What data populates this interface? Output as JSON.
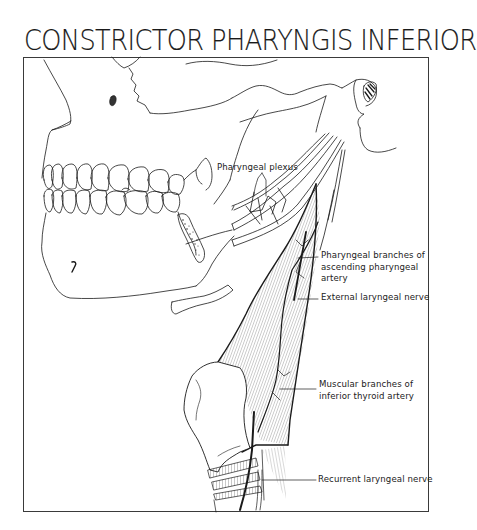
{
  "figure": {
    "title": "CONSTRICTOR PHARYNGIS INFERIOR",
    "labels": {
      "pharyngeal_plexus": "Pharyngeal plexus",
      "pharyngeal_branches": {
        "line1": "Pharyngeal branches of",
        "line2": "ascending pharyngeal",
        "line3": "artery"
      },
      "external_laryngeal_nerve": "External laryngeal nerve",
      "muscular_branches": {
        "line1": "Muscular branches of",
        "line2": "inferior thyroid artery"
      },
      "recurrent_laryngeal_nerve": "Recurrent laryngeal nerve"
    },
    "structures": [
      "skull-lateral-view",
      "maxillary-teeth",
      "mandibular-teeth",
      "mandible",
      "hyoid-bone",
      "thyroid-cartilage",
      "trachea-rings",
      "inferior-constrictor-muscle",
      "stylo-muscles"
    ],
    "colors": {
      "ink": "#1a1a1a",
      "paper": "#ffffff",
      "hatching": "#555555"
    }
  }
}
